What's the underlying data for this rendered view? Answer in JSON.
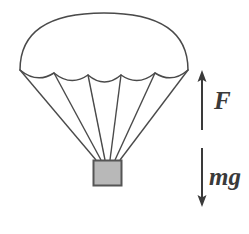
{
  "figure": {
    "background_color": "#ffffff",
    "stroke_color": "#4a4a4a"
  },
  "canopy": {
    "name": "parachute-canopy",
    "apex": {
      "x": 104,
      "y": 17
    },
    "left_tip": {
      "x": 20,
      "y": 70
    },
    "right_tip": {
      "x": 188,
      "y": 70
    },
    "stroke_color": "#4a4a4a",
    "fill_color": "#ffffff",
    "scallop_count": 5,
    "attachment_points": [
      {
        "x": 20,
        "y": 70
      },
      {
        "x": 54,
        "y": 73
      },
      {
        "x": 88,
        "y": 75
      },
      {
        "x": 121,
        "y": 75
      },
      {
        "x": 155,
        "y": 73
      },
      {
        "x": 188,
        "y": 70
      }
    ]
  },
  "suspension_lines": {
    "name": "suspension-lines",
    "count": 6,
    "stroke_color": "#4a4a4a",
    "converge_at": {
      "x": 107,
      "y": 160
    }
  },
  "payload": {
    "name": "payload-box",
    "x": 93,
    "y": 160,
    "width": 29,
    "height": 26,
    "fill_color": "#b8b8b8",
    "stroke_color": "#555555"
  },
  "forces": [
    {
      "name": "force-up",
      "label": "F",
      "direction": "up",
      "x": 202,
      "y_start": 130,
      "y_end": 72,
      "color": "#3a3a3a",
      "label_x": 214,
      "label_y": 88
    },
    {
      "name": "force-down",
      "label": "mg",
      "direction": "down",
      "x": 202,
      "y_start": 148,
      "y_end": 205,
      "color": "#3a3a3a",
      "label_x": 209,
      "label_y": 164
    }
  ],
  "labels": {
    "force_up": "F",
    "force_down": "mg"
  }
}
